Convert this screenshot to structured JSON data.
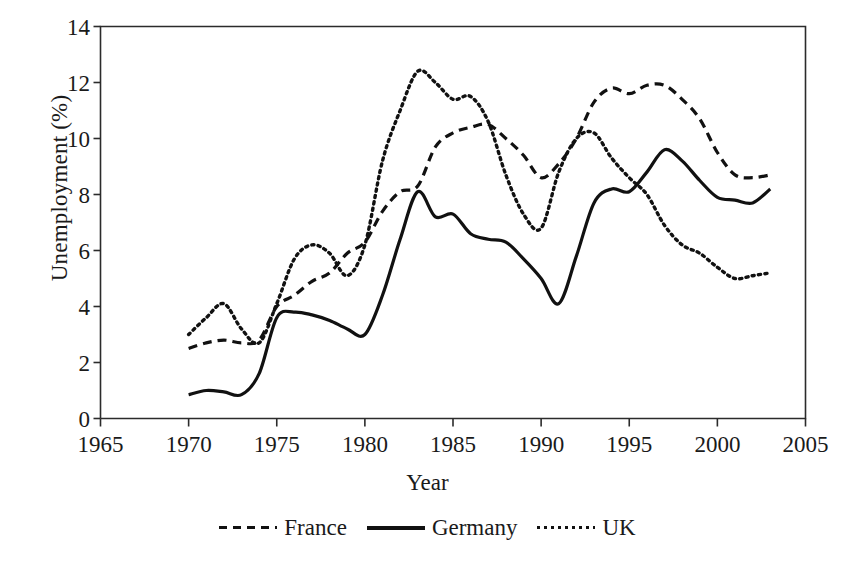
{
  "chart_data": {
    "type": "line",
    "title": "",
    "xlabel": "Year",
    "ylabel": "Unemployment (%)",
    "xlim": [
      1965,
      2005
    ],
    "ylim": [
      0,
      14
    ],
    "xticks": [
      1965,
      1970,
      1975,
      1980,
      1985,
      1990,
      1995,
      2000,
      2005
    ],
    "yticks": [
      0,
      2,
      4,
      6,
      8,
      10,
      12,
      14
    ],
    "grid": false,
    "legend_position": "below-axis-center",
    "x": [
      1970,
      1971,
      1972,
      1973,
      1974,
      1975,
      1976,
      1977,
      1978,
      1979,
      1980,
      1981,
      1982,
      1983,
      1984,
      1985,
      1986,
      1987,
      1988,
      1989,
      1990,
      1991,
      1992,
      1993,
      1994,
      1995,
      1996,
      1997,
      1998,
      1999,
      2000,
      2001,
      2002,
      2003
    ],
    "series": [
      {
        "name": "France",
        "style": "dashed",
        "color": "#111111",
        "values": [
          2.5,
          2.7,
          2.8,
          2.7,
          2.8,
          4.0,
          4.4,
          4.9,
          5.2,
          5.9,
          6.3,
          7.4,
          8.1,
          8.3,
          9.7,
          10.2,
          10.4,
          10.5,
          10.0,
          9.4,
          8.6,
          9.1,
          10.0,
          11.3,
          11.8,
          11.6,
          11.9,
          11.9,
          11.4,
          10.7,
          9.5,
          8.7,
          8.6,
          8.7
        ]
      },
      {
        "name": "Germany",
        "style": "solid",
        "color": "#111111",
        "values": [
          0.85,
          1.0,
          0.95,
          0.85,
          1.6,
          3.6,
          3.8,
          3.7,
          3.5,
          3.2,
          3.0,
          4.4,
          6.4,
          8.1,
          7.2,
          7.3,
          6.6,
          6.4,
          6.3,
          5.7,
          5.0,
          4.1,
          5.8,
          7.7,
          8.2,
          8.1,
          8.8,
          9.6,
          9.2,
          8.5,
          7.9,
          7.8,
          7.7,
          8.2
        ]
      },
      {
        "name": "UK",
        "style": "dotted",
        "color": "#111111",
        "values": [
          3.0,
          3.6,
          4.1,
          3.2,
          2.7,
          4.1,
          5.7,
          6.2,
          5.9,
          5.1,
          6.2,
          9.2,
          11.0,
          12.4,
          12.0,
          11.4,
          11.5,
          10.6,
          8.7,
          7.3,
          6.8,
          8.8,
          10.0,
          10.2,
          9.3,
          8.6,
          8.0,
          6.9,
          6.2,
          5.9,
          5.4,
          5.0,
          5.1,
          5.2
        ]
      }
    ]
  },
  "axis": {
    "ylabel_text": "Unemployment (%)",
    "xlabel_text": "Year",
    "ytick_labels": [
      "0",
      "2",
      "4",
      "6",
      "8",
      "10",
      "12",
      "14"
    ],
    "xtick_labels": [
      "1965",
      "1970",
      "1975",
      "1980",
      "1985",
      "1990",
      "1995",
      "2000",
      "2005"
    ]
  },
  "legend": {
    "entries": [
      {
        "label": "France",
        "style": "dashed"
      },
      {
        "label": "Germany",
        "style": "solid"
      },
      {
        "label": "UK",
        "style": "dotted"
      }
    ]
  }
}
